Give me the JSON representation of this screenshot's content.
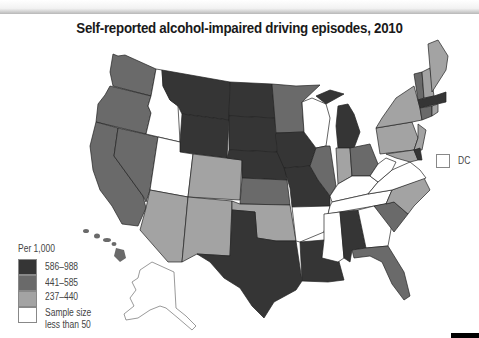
{
  "title": "Self-reported alcohol-impaired driving episodes, 2010",
  "legend": {
    "title": "Per 1,000",
    "items": [
      {
        "label": "586–988",
        "color": "#353535"
      },
      {
        "label": "441–585",
        "color": "#6a6a6a"
      },
      {
        "label": "237–440",
        "color": "#a3a3a3"
      },
      {
        "label": "Sample size less than 50",
        "line1": "Sample size",
        "line2": "less than 50",
        "color": "#ffffff"
      }
    ]
  },
  "dc": {
    "label": "DC",
    "category": "Sample size less than 50"
  },
  "colors": {
    "high": "#353535",
    "mid": "#6a6a6a",
    "low": "#a3a3a3",
    "none": "#ffffff",
    "border": "#222222"
  },
  "states": {
    "586-988": [
      "MT",
      "WY",
      "ND",
      "SD",
      "NE",
      "IA",
      "MO",
      "TX",
      "LA",
      "AL",
      "MI",
      "MA",
      "DE"
    ],
    "441-585": [
      "WA",
      "OR",
      "CA",
      "NV",
      "MN",
      "KS",
      "IL",
      "OH",
      "SC",
      "FL",
      "HI",
      "VT",
      "CT"
    ],
    "237-440": [
      "AZ",
      "CO",
      "NM",
      "OK",
      "IN",
      "NY",
      "PA",
      "NC",
      "ME",
      "NH",
      "NJ",
      "RI",
      "MD"
    ],
    "sample-less-than-50": [
      "ID",
      "UT",
      "WI",
      "AR",
      "MS",
      "TN",
      "KY",
      "GA",
      "VA",
      "WV",
      "AK",
      "DC"
    ]
  }
}
